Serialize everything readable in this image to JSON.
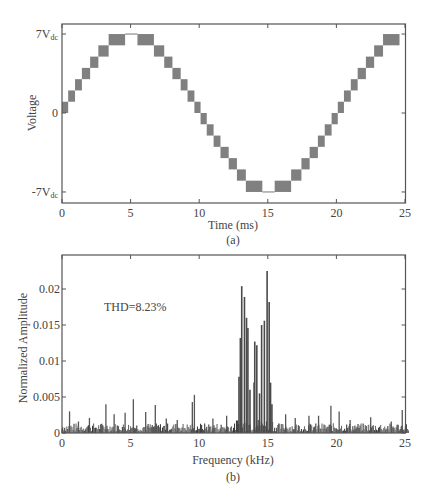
{
  "chart_data": [
    {
      "id": "a",
      "type": "line",
      "subtitle": "(a)",
      "title": "",
      "xlabel": "Time (ms)",
      "ylabel": "Voltage",
      "xlim": [
        0,
        25.3
      ],
      "ylim": [
        -8,
        8
      ],
      "x_ticks": [
        0,
        5,
        10,
        15,
        20,
        25
      ],
      "y_ticks": [
        {
          "value": 7,
          "label": "7V",
          "sub": "dc"
        },
        {
          "value": 0,
          "label": "0",
          "sub": ""
        },
        {
          "value": -7,
          "label": "-7V",
          "sub": "dc"
        }
      ],
      "grid": false,
      "description": "15-level staircase (multilevel inverter) output; gray blocks show PWM switching between adjacent levels over one ~20ms fundamental period",
      "series": [
        {
          "name": "Output voltage (level blocks)",
          "color": "#808080",
          "blocks": [
            {
              "t0": 0.0,
              "t1": 0.45,
              "lo": 0,
              "hi": 1
            },
            {
              "t0": 0.45,
              "t1": 0.95,
              "lo": 1,
              "hi": 2
            },
            {
              "t0": 0.95,
              "t1": 1.45,
              "lo": 2,
              "hi": 3
            },
            {
              "t0": 1.45,
              "t1": 2.05,
              "lo": 3,
              "hi": 4
            },
            {
              "t0": 2.05,
              "t1": 2.65,
              "lo": 4,
              "hi": 5
            },
            {
              "t0": 2.65,
              "t1": 3.4,
              "lo": 5,
              "hi": 6
            },
            {
              "t0": 3.4,
              "t1": 4.6,
              "lo": 6,
              "hi": 7
            },
            {
              "t0": 5.5,
              "t1": 6.7,
              "lo": 6,
              "hi": 7
            },
            {
              "t0": 6.7,
              "t1": 7.45,
              "lo": 5,
              "hi": 6
            },
            {
              "t0": 7.45,
              "t1": 8.05,
              "lo": 4,
              "hi": 5
            },
            {
              "t0": 8.05,
              "t1": 8.65,
              "lo": 3,
              "hi": 4
            },
            {
              "t0": 8.65,
              "t1": 9.15,
              "lo": 2,
              "hi": 3
            },
            {
              "t0": 9.15,
              "t1": 9.65,
              "lo": 1,
              "hi": 2
            },
            {
              "t0": 9.65,
              "t1": 10.1,
              "lo": 0,
              "hi": 1
            },
            {
              "t0": 10.1,
              "t1": 10.55,
              "lo": -1,
              "hi": 0
            },
            {
              "t0": 10.55,
              "t1": 11.05,
              "lo": -2,
              "hi": -1
            },
            {
              "t0": 11.05,
              "t1": 11.55,
              "lo": -3,
              "hi": -2
            },
            {
              "t0": 11.55,
              "t1": 12.15,
              "lo": -4,
              "hi": -3
            },
            {
              "t0": 12.15,
              "t1": 12.75,
              "lo": -5,
              "hi": -4
            },
            {
              "t0": 12.75,
              "t1": 13.4,
              "lo": -6,
              "hi": -5
            },
            {
              "t0": 13.4,
              "t1": 14.6,
              "lo": -7,
              "hi": -6
            },
            {
              "t0": 15.5,
              "t1": 16.7,
              "lo": -7,
              "hi": -6
            },
            {
              "t0": 16.7,
              "t1": 17.45,
              "lo": -6,
              "hi": -5
            },
            {
              "t0": 17.45,
              "t1": 18.05,
              "lo": -5,
              "hi": -4
            },
            {
              "t0": 18.05,
              "t1": 18.65,
              "lo": -4,
              "hi": -3
            },
            {
              "t0": 18.65,
              "t1": 19.15,
              "lo": -3,
              "hi": -2
            },
            {
              "t0": 19.15,
              "t1": 19.65,
              "lo": -2,
              "hi": -1
            },
            {
              "t0": 19.65,
              "t1": 20.1,
              "lo": -1,
              "hi": 0
            },
            {
              "t0": 20.1,
              "t1": 20.55,
              "lo": 0,
              "hi": 1
            },
            {
              "t0": 20.55,
              "t1": 21.05,
              "lo": 1,
              "hi": 2
            },
            {
              "t0": 21.05,
              "t1": 21.55,
              "lo": 2,
              "hi": 3
            },
            {
              "t0": 21.55,
              "t1": 22.15,
              "lo": 3,
              "hi": 4
            },
            {
              "t0": 22.15,
              "t1": 22.75,
              "lo": 4,
              "hi": 5
            },
            {
              "t0": 22.75,
              "t1": 23.4,
              "lo": 5,
              "hi": 6
            },
            {
              "t0": 23.4,
              "t1": 24.6,
              "lo": 6,
              "hi": 7
            }
          ],
          "flat_segments": [
            {
              "t0": 4.6,
              "t1": 5.5,
              "level": 7
            },
            {
              "t0": 14.6,
              "t1": 15.5,
              "level": -7
            }
          ]
        }
      ]
    },
    {
      "id": "b",
      "type": "bar",
      "subtitle": "(b)",
      "title": "",
      "xlabel": "Frequency (kHz)",
      "ylabel": "Normalized Amplitude",
      "xlim": [
        0,
        25.3
      ],
      "ylim": [
        0,
        0.0247
      ],
      "x_ticks": [
        0,
        5,
        10,
        15,
        20,
        25
      ],
      "y_ticks": [
        0,
        0.005,
        0.01,
        0.015,
        0.02
      ],
      "y_tick_labels": [
        "0",
        "0.005",
        "0.01",
        "0.015",
        "0.02"
      ],
      "grid": false,
      "annotation": "THD=8.23%",
      "series": [
        {
          "name": "Harmonic spectrum",
          "color": "#555555",
          "major_peaks": [
            {
              "f": 12.9,
              "a": 0.0078
            },
            {
              "f": 13.0,
              "a": 0.0132
            },
            {
              "f": 13.1,
              "a": 0.0204
            },
            {
              "f": 13.3,
              "a": 0.0189
            },
            {
              "f": 13.45,
              "a": 0.016
            },
            {
              "f": 13.55,
              "a": 0.0146
            },
            {
              "f": 13.7,
              "a": 0.006
            },
            {
              "f": 14.0,
              "a": 0.007
            },
            {
              "f": 14.05,
              "a": 0.0127
            },
            {
              "f": 14.2,
              "a": 0.0122
            },
            {
              "f": 14.4,
              "a": 0.0055
            },
            {
              "f": 14.55,
              "a": 0.015
            },
            {
              "f": 14.75,
              "a": 0.0156
            },
            {
              "f": 14.95,
              "a": 0.0225
            },
            {
              "f": 15.1,
              "a": 0.0182
            },
            {
              "f": 15.2,
              "a": 0.007
            },
            {
              "f": 15.3,
              "a": 0.004
            }
          ],
          "notable_minor_peaks": [
            {
              "f": 0.55,
              "a": 0.003
            },
            {
              "f": 1.2,
              "a": 0.0016
            },
            {
              "f": 2.0,
              "a": 0.0021
            },
            {
              "f": 3.2,
              "a": 0.004
            },
            {
              "f": 3.8,
              "a": 0.0026
            },
            {
              "f": 4.6,
              "a": 0.0028
            },
            {
              "f": 5.2,
              "a": 0.0047
            },
            {
              "f": 6.1,
              "a": 0.0029
            },
            {
              "f": 6.8,
              "a": 0.0039
            },
            {
              "f": 7.6,
              "a": 0.002
            },
            {
              "f": 8.4,
              "a": 0.0018
            },
            {
              "f": 9.5,
              "a": 0.0043
            },
            {
              "f": 9.65,
              "a": 0.0053
            },
            {
              "f": 11.0,
              "a": 0.002
            },
            {
              "f": 12.0,
              "a": 0.0024
            },
            {
              "f": 16.3,
              "a": 0.0026
            },
            {
              "f": 17.0,
              "a": 0.0021
            },
            {
              "f": 18.0,
              "a": 0.0024
            },
            {
              "f": 18.7,
              "a": 0.0024
            },
            {
              "f": 19.6,
              "a": 0.0038
            },
            {
              "f": 20.2,
              "a": 0.003
            },
            {
              "f": 21.0,
              "a": 0.0018
            },
            {
              "f": 22.5,
              "a": 0.0022
            },
            {
              "f": 24.0,
              "a": 0.0016
            },
            {
              "f": 24.8,
              "a": 0.0032
            }
          ],
          "noise_floor": 0.0008
        }
      ]
    }
  ],
  "labels": {
    "a_ylabel": "Voltage",
    "a_xlabel": "Time (ms)",
    "a_caption": "(a)",
    "b_ylabel": "Normalized Amplitude",
    "b_xlabel": "Frequency (kHz)",
    "b_caption": "(b)",
    "b_annotation": "THD=8.23%"
  }
}
